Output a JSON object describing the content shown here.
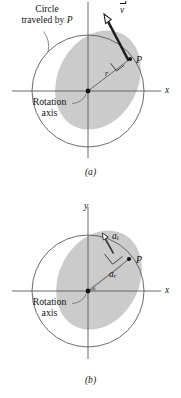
{
  "figure": {
    "panels": [
      {
        "id": "a",
        "caption": "(a)",
        "axis_x_label": "x",
        "axis_y_label": "y",
        "annotations": {
          "circle_label_line1": "Circle",
          "circle_label_line2": "traveled by",
          "circle_label_italic": "P",
          "rotation_label_line1": "Rotation",
          "rotation_label_line2": "axis",
          "point_label": "P",
          "radius_label": "r",
          "velocity_label": "v"
        }
      },
      {
        "id": "b",
        "caption": "(b)",
        "axis_x_label": "x",
        "axis_y_label": "y",
        "annotations": {
          "rotation_label_line1": "Rotation",
          "rotation_label_line2": "axis",
          "point_label": "P",
          "tangential_accel_label": "a",
          "tangential_accel_sub": "t",
          "radial_accel_label": "a",
          "radial_accel_sub": "r"
        }
      }
    ],
    "colors": {
      "background": "#ffffff",
      "ink": "#141414",
      "axis_line": "#555555",
      "circle_line": "#4d4d4d",
      "disk_fill": "#cccccc",
      "vector": "#1a1a1a",
      "leader": "#6b6b6b"
    },
    "geometry": {
      "origin_x": 88,
      "origin_y": 91,
      "circle_radius": 56,
      "point_p_x": 130,
      "point_p_y": 59
    }
  }
}
